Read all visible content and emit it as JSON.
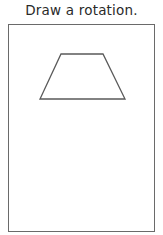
{
  "prompt": {
    "title": "Draw a rotation."
  },
  "canvas": {
    "shape": {
      "type": "trapezoid",
      "points": "61,54 103,54 125,99 40,99",
      "stroke": "#5a5a5a",
      "fill": "none"
    }
  }
}
